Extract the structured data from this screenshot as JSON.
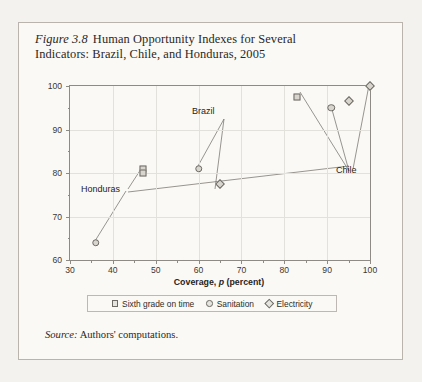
{
  "figure": {
    "number": "Figure 3.8",
    "title_line1": "Human Opportunity Indexes for Several",
    "title_line2": "Indicators: Brazil, Chile, and Honduras, 2005",
    "source_prefix": "Source:",
    "source_text": "Authors' computations."
  },
  "chart_data": {
    "type": "scatter",
    "title": "Human Opportunity Indexes for Several Indicators: Brazil, Chile, and Honduras, 2005",
    "xlabel_plain": "Coverage, p (percent)",
    "xlabel_pre": "Coverage, ",
    "xlabel_italic": "p",
    "xlabel_post": " (percent)",
    "ylabel_plain": "Equality of opportunity, 1-D (percent)",
    "ylabel_pre": "Equality of opportunity, 1-",
    "ylabel_italic": "D",
    "ylabel_post": " (percent)",
    "xlim": [
      30,
      100
    ],
    "ylim": [
      60,
      100
    ],
    "xticks": [
      30,
      40,
      50,
      60,
      70,
      80,
      90,
      100
    ],
    "yticks": [
      60,
      70,
      80,
      90,
      100
    ],
    "x_minor_step": 5,
    "y_minor_step": 5,
    "grid": true,
    "legend_position": "below-axes",
    "series": [
      {
        "name": "Sixth grade on time",
        "marker": "square",
        "points": [
          {
            "country": "Honduras",
            "x": 47,
            "y": 81
          },
          {
            "country": "Honduras",
            "x": 47,
            "y": 80
          },
          {
            "country": "Chile",
            "x": 83,
            "y": 97.5
          }
        ]
      },
      {
        "name": "Sanitation",
        "marker": "circle",
        "points": [
          {
            "country": "Honduras",
            "x": 36,
            "y": 64
          },
          {
            "country": "Brazil",
            "x": 60,
            "y": 81
          },
          {
            "country": "Chile",
            "x": 91,
            "y": 95
          }
        ]
      },
      {
        "name": "Electricity",
        "marker": "diamond",
        "points": [
          {
            "country": "Brazil",
            "x": 65,
            "y": 77.5
          },
          {
            "country": "Chile",
            "x": 95,
            "y": 96.5
          },
          {
            "country": "Chile",
            "x": 100,
            "y": 100
          }
        ]
      }
    ],
    "annotations": [
      {
        "label": "Honduras",
        "x": 41.5,
        "y": 75.5
      },
      {
        "label": "Brazil",
        "x": 67.5,
        "y": 91.5
      },
      {
        "label": "Chile",
        "x": 90.5,
        "y": 86.5
      }
    ]
  },
  "legend": {
    "items": [
      {
        "marker": "square",
        "label": "Sixth grade on time"
      },
      {
        "marker": "circle",
        "label": "Sanitation"
      },
      {
        "marker": "diamond",
        "label": "Electricity"
      }
    ]
  },
  "axis_tick_labels": {
    "x": [
      "30",
      "40",
      "50",
      "60",
      "70",
      "80",
      "90",
      "100"
    ],
    "y": [
      "60",
      "70",
      "80",
      "90",
      "100"
    ]
  },
  "colors": {
    "page": "#f4f2ee",
    "panel": "#faf9f6",
    "border": "#b9b4ac",
    "axis": "#8e8a84",
    "grid": "#e3e1dc",
    "marker_fill": "#d8d5cf",
    "marker_stroke": "#6d6963",
    "text": "#2a2724"
  }
}
